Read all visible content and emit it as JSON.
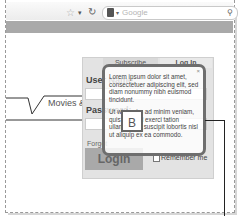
{
  "browser": {
    "search_placeholder": "Google",
    "icons": {
      "bookmark": "star-icon",
      "dropdown": "chevron-down-icon",
      "reload": "reload-icon",
      "search_engine": "google-logo-icon",
      "search": "magnifier-icon"
    },
    "star_glyph": "☆",
    "dropdown_glyph": "▾",
    "reload_glyph": "↻",
    "engine_dd_glyph": "▾",
    "search_glyph": "⚲"
  },
  "nav": {
    "tab_label": "Movies &"
  },
  "login_panel": {
    "tabs": [
      {
        "label": "Subscribe"
      },
      {
        "label": "Log In"
      }
    ],
    "username_label": "User Name:",
    "password_label": "Password:",
    "forgot_label": "Forgot",
    "login_button": "Login",
    "remember_label": "Remember me"
  },
  "callout": {
    "close_glyph": "×",
    "paragraph1": "Lorem ipsum dolor sit amet, consectetuer adipiscing elit, sed diam nonummy nibh euismod tincidunt.",
    "paragraph2": "Ut wisi enim ad minim veniam, quis nostrud exerci tation ullamcorper suscipit lobortis nisl ut aliquip ex ea commodo.",
    "badge": "B"
  },
  "colors": {
    "navbar": "#a9a9a9",
    "panel": "#e3e3e3",
    "login_button": "#a9a9a9",
    "callout_border": "#6e6e6e"
  }
}
